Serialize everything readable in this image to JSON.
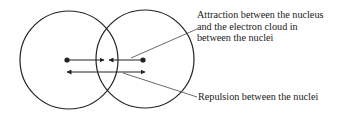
{
  "diagram": {
    "colors": {
      "stroke": "#222222",
      "leader": "#444444",
      "text": "#222222",
      "background": "#ffffff"
    },
    "atoms": [
      {
        "id": "left",
        "nucleus": "left-nucleus"
      },
      {
        "id": "right",
        "nucleus": "right-nucleus"
      }
    ],
    "labels": {
      "attraction": {
        "lines": [
          "Attraction between the nucleus",
          "and the electron cloud in",
          "between the nuclei"
        ]
      },
      "repulsion": {
        "lines": [
          "Repulsion between the nuclei"
        ]
      }
    }
  }
}
